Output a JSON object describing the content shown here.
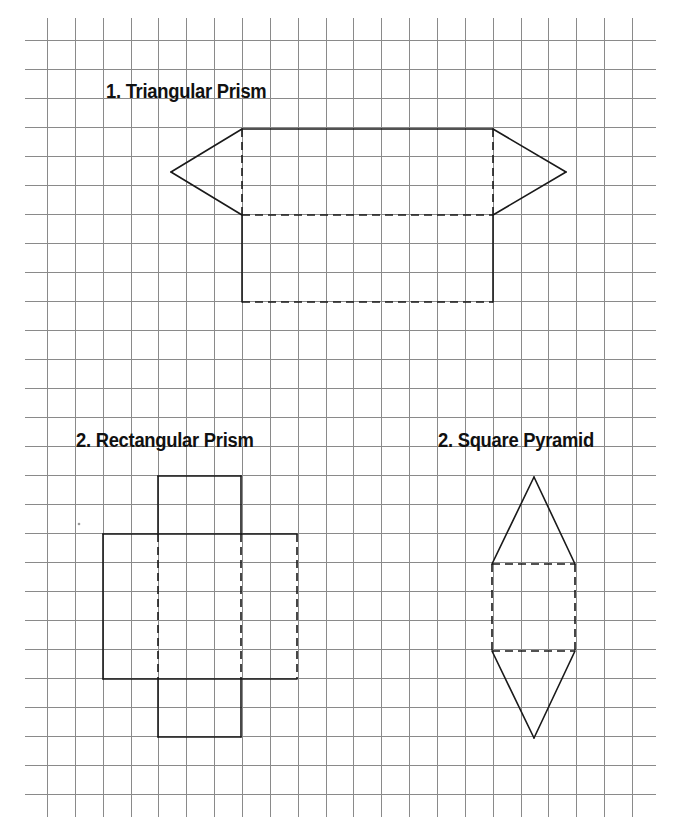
{
  "page": {
    "width": 678,
    "height": 820,
    "background": "#ffffff"
  },
  "grid": {
    "x_start": 47,
    "x_step": 27.86,
    "x_count": 22,
    "y_start": 40.3,
    "y_step": 29.0,
    "y_count": 27,
    "h_line_extent": [
      25,
      656
    ],
    "v_line_extent": [
      18,
      817
    ],
    "line_color": "#8a8a8a",
    "line_width": 1
  },
  "shape_style": {
    "stroke": "#1a1a1a",
    "stroke_width": 1.6,
    "dash": "8,5"
  },
  "titles": [
    {
      "id": "triangular-prism",
      "text": "1. Triangular Prism"
    },
    {
      "id": "rectangular-prism",
      "text": "2. Rectangular Prism"
    },
    {
      "id": "square-pyramid",
      "text": "2. Square Pyramid"
    }
  ],
  "nets": {
    "triangular_prism": {
      "label": "1. Triangular Prism",
      "solid": [
        [
          [
            242,
            129
          ],
          [
            493,
            129
          ]
        ],
        [
          [
            242,
            129
          ],
          [
            171,
            172
          ]
        ],
        [
          [
            171,
            172
          ],
          [
            242,
            215
          ]
        ],
        [
          [
            493,
            129
          ],
          [
            566,
            172
          ]
        ],
        [
          [
            566,
            172
          ],
          [
            493,
            215
          ]
        ],
        [
          [
            242,
            215
          ],
          [
            242,
            302
          ]
        ],
        [
          [
            493,
            215
          ],
          [
            493,
            302
          ]
        ]
      ],
      "dashed": [
        [
          [
            242,
            129
          ],
          [
            242,
            215
          ]
        ],
        [
          [
            493,
            129
          ],
          [
            493,
            215
          ]
        ],
        [
          [
            242,
            215
          ],
          [
            493,
            215
          ]
        ],
        [
          [
            242,
            302
          ],
          [
            493,
            302
          ]
        ]
      ]
    },
    "rectangular_prism": {
      "label": "2. Rectangular Prism",
      "solid": [
        [
          [
            158,
            476
          ],
          [
            241,
            476
          ]
        ],
        [
          [
            158,
            476
          ],
          [
            158,
            534
          ]
        ],
        [
          [
            241,
            476
          ],
          [
            241,
            534
          ]
        ],
        [
          [
            103,
            534
          ],
          [
            297,
            534
          ]
        ],
        [
          [
            103,
            534
          ],
          [
            103,
            679
          ]
        ],
        [
          [
            103,
            679
          ],
          [
            297,
            679
          ]
        ],
        [
          [
            158,
            679
          ],
          [
            158,
            737
          ]
        ],
        [
          [
            241,
            679
          ],
          [
            241,
            737
          ]
        ],
        [
          [
            158,
            737
          ],
          [
            241,
            737
          ]
        ]
      ],
      "dashed": [
        [
          [
            158,
            534
          ],
          [
            158,
            679
          ]
        ],
        [
          [
            241,
            534
          ],
          [
            241,
            679
          ]
        ],
        [
          [
            297,
            534
          ],
          [
            297,
            679
          ]
        ]
      ]
    },
    "square_pyramid": {
      "label": "2. Square Pyramid",
      "solid": [
        [
          [
            534,
            477
          ],
          [
            492,
            564
          ]
        ],
        [
          [
            534,
            477
          ],
          [
            575,
            564
          ]
        ],
        [
          [
            492,
            651
          ],
          [
            534,
            738
          ]
        ],
        [
          [
            575,
            651
          ],
          [
            534,
            738
          ]
        ]
      ],
      "dashed": [
        [
          [
            492,
            564
          ],
          [
            575,
            564
          ]
        ],
        [
          [
            492,
            564
          ],
          [
            492,
            651
          ]
        ],
        [
          [
            575,
            564
          ],
          [
            575,
            651
          ]
        ],
        [
          [
            492,
            651
          ],
          [
            575,
            651
          ]
        ]
      ]
    }
  },
  "marks": [
    {
      "x": 79,
      "y": 524,
      "r": 1.3,
      "color": "#9a9a9a"
    }
  ]
}
